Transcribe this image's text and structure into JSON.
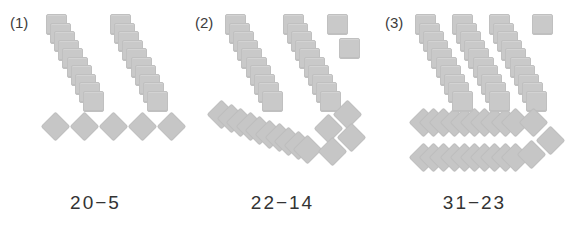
{
  "figure": {
    "type": "base-ten-block-subtraction-diagram",
    "background_color": "#ffffff",
    "block_color": "#c9c9c9",
    "text_color": "#333333",
    "tens_unit_size": 10,
    "panels": [
      {
        "index_label": "(1)",
        "equation": "20−5",
        "minuend": 20,
        "subtrahend": 5,
        "squares": {
          "total": 20,
          "diagonal_stacks": 2,
          "per_stack": 10,
          "loose": 0,
          "loose_layout": "none"
        },
        "diamonds": {
          "total": 5,
          "rows": [],
          "loose": 5,
          "loose_layout": "horizontal-line"
        }
      },
      {
        "index_label": "(2)",
        "equation": "22−14",
        "minuend": 22,
        "subtrahend": 14,
        "squares": {
          "total": 22,
          "diagonal_stacks": 2,
          "per_stack": 10,
          "loose": 2,
          "loose_layout": "diagonal-pair"
        },
        "diamonds": {
          "total": 14,
          "rows": [
            10
          ],
          "rows_layout": "slanted-overlapping-row",
          "loose": 4,
          "loose_layout": "two-by-two-diagonal"
        }
      },
      {
        "index_label": "(3)",
        "equation": "31−23",
        "minuend": 31,
        "subtrahend": 23,
        "squares": {
          "total": 31,
          "diagonal_stacks": 3,
          "per_stack": 10,
          "loose": 1,
          "loose_layout": "single"
        },
        "diamonds": {
          "total": 23,
          "rows": [
            10,
            10
          ],
          "rows_layout": "horizontal-overlapping-rows",
          "loose": 3,
          "loose_layout": "diagonal-triple"
        }
      }
    ]
  }
}
